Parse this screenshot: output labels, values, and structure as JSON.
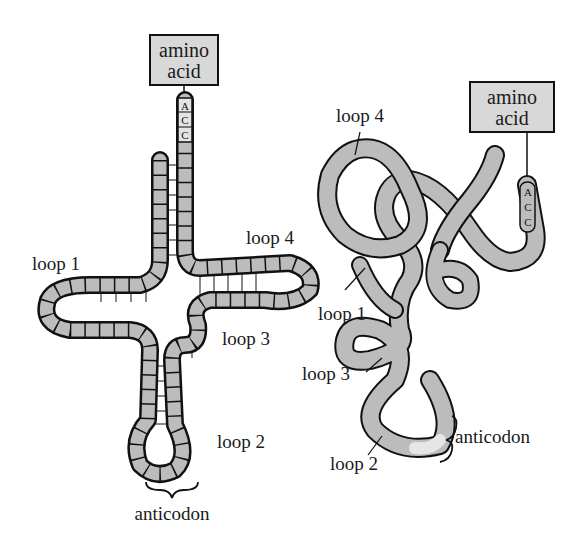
{
  "diagram": {
    "colors": {
      "strand_fill": "#bcbcbc",
      "strand_outline": "#111111",
      "box_fill": "#d8d8d8",
      "rung": "#8a8a8a",
      "highlight": "#e6e6e6"
    },
    "cloverleaf": {
      "amino_acid_box": {
        "line1": "amino",
        "line2": "acid"
      },
      "terminal_bases": [
        "A",
        "C",
        "C"
      ],
      "labels": {
        "loop1": "loop 1",
        "loop2": "loop 2",
        "loop3": "loop 3",
        "loop4": "loop 4",
        "anticodon": "anticodon"
      }
    },
    "folded": {
      "amino_acid_box": {
        "line1": "amino",
        "line2": "acid"
      },
      "terminal_bases": [
        "A",
        "C",
        "C"
      ],
      "labels": {
        "loop1": "loop 1",
        "loop2": "loop 2",
        "loop3": "loop 3",
        "loop4": "loop 4",
        "anticodon": "anticodon"
      }
    }
  }
}
